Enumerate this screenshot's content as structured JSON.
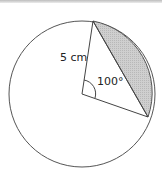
{
  "diagram": {
    "type": "circle-segment",
    "radius_label": "5 cm",
    "angle_label": "100°",
    "colors": {
      "stroke": "#555555",
      "segment_fill": "#c8c8c8",
      "background": "#ffffff"
    }
  }
}
